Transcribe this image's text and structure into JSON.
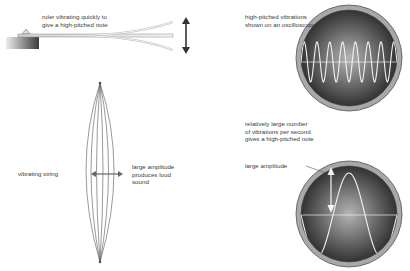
{
  "labels": {
    "ruler": "ruler vibrating quickly to\ngive a high-pitched note",
    "osc_high": "high-pitched vibrations\nshown on an oscilloscope",
    "many_vibrations": "relatively large number\nof vibrations per second\ngives a high-pitched note",
    "string": "vibrating string",
    "loud": "large amplitude\nproduces loud\nsound",
    "amplitude": "large amplitude"
  },
  "colors": {
    "screen_center": "#b0b0b0",
    "screen_edge": "#2a2a2a",
    "rim": "#9a9a9a",
    "wave": "#f2f2f2",
    "line": "#555555"
  },
  "oscilloscopes": [
    {
      "name": "high-frequency",
      "cycles": 7.5,
      "cx": 349,
      "cy": 58
    },
    {
      "name": "large-amplitude",
      "cycles": 1.5,
      "cx": 349,
      "cy": 214
    }
  ]
}
